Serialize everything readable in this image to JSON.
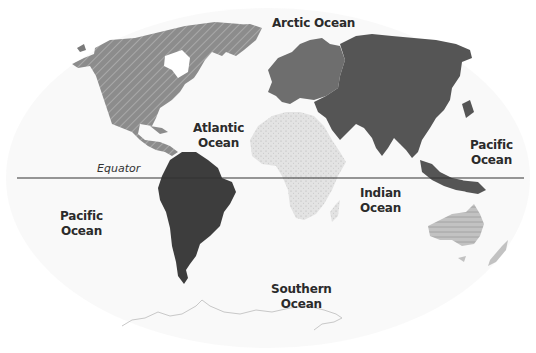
{
  "map": {
    "type": "world-continents-oceans",
    "colors": {
      "background": "#ffffff",
      "ocean_texture": "#f3f3f3",
      "north_america": "#8c8c8c",
      "north_america_hatch": "#a8a8a8",
      "south_america": "#3d3d3d",
      "europe": "#6e6e6e",
      "asia": "#545454",
      "africa": "#e2e2e2",
      "australia": "#bdbdbd",
      "australia_hatch": "#9a9a9a",
      "antarctica_outline": "#c8c8c8",
      "equator_line": "#333333",
      "label_text": "#2b2b2b"
    },
    "equator": {
      "label": "Equator",
      "y": 178,
      "x_start": 17,
      "x_end": 524
    },
    "oceans": [
      {
        "name": "Arctic Ocean",
        "label": "Arctic Ocean",
        "x": 272,
        "y": 16
      },
      {
        "name": "Atlantic Ocean",
        "label": "Atlantic\nOcean",
        "x": 193,
        "y": 121
      },
      {
        "name": "Pacific Ocean (east)",
        "label": "Pacific\nOcean",
        "x": 470,
        "y": 138
      },
      {
        "name": "Pacific Ocean (west)",
        "label": "Pacific\nOcean",
        "x": 60,
        "y": 209
      },
      {
        "name": "Indian Ocean",
        "label": "Indian\nOcean",
        "x": 360,
        "y": 186
      },
      {
        "name": "Southern Ocean",
        "label": "Southern\nOcean",
        "x": 271,
        "y": 282
      }
    ],
    "continents": [
      {
        "name": "North America",
        "pattern": "diagonal-hatch"
      },
      {
        "name": "South America",
        "pattern": "solid-dark"
      },
      {
        "name": "Europe",
        "pattern": "solid-medium"
      },
      {
        "name": "Asia",
        "pattern": "solid-dark-gray"
      },
      {
        "name": "Africa",
        "pattern": "dotted-light"
      },
      {
        "name": "Australia",
        "pattern": "horizontal-lines"
      },
      {
        "name": "Antarctica",
        "pattern": "outline"
      }
    ]
  }
}
